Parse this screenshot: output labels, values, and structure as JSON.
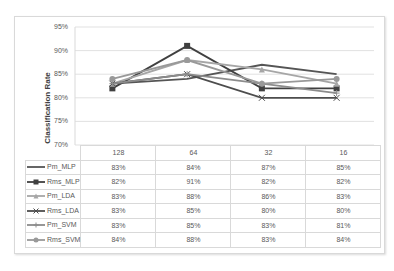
{
  "chart_data": {
    "type": "line",
    "title": "",
    "xlabel": "",
    "ylabel": "Classification Rate",
    "ylim": [
      70,
      95
    ],
    "yticks": [
      "95%",
      "90%",
      "85%",
      "80%",
      "75%",
      "70%"
    ],
    "grid": true,
    "legend_position": "data-table",
    "categories": [
      "128",
      "64",
      "32",
      "16"
    ],
    "series": [
      {
        "name": "Pm_MLP",
        "values": [
          83,
          84,
          87,
          85
        ],
        "labels": [
          "83%",
          "84%",
          "87%",
          "85%"
        ],
        "color": "#555555",
        "marker": "none"
      },
      {
        "name": "Rms_MLP",
        "values": [
          82,
          91,
          82,
          82
        ],
        "labels": [
          "82%",
          "91%",
          "82%",
          "82%"
        ],
        "color": "#404040",
        "marker": "square"
      },
      {
        "name": "Pm_LDA",
        "values": [
          83,
          88,
          86,
          83
        ],
        "labels": [
          "83%",
          "88%",
          "86%",
          "83%"
        ],
        "color": "#a6a6a6",
        "marker": "triangle"
      },
      {
        "name": "Rms_LDA",
        "values": [
          83,
          85,
          80,
          80
        ],
        "labels": [
          "83%",
          "85%",
          "80%",
          "80%"
        ],
        "color": "#4d4d4d",
        "marker": "x"
      },
      {
        "name": "Pm_SVM",
        "values": [
          83,
          85,
          83,
          81
        ],
        "labels": [
          "83%",
          "85%",
          "83%",
          "81%"
        ],
        "color": "#8c8c8c",
        "marker": "cross"
      },
      {
        "name": "Rms_SVM",
        "values": [
          84,
          88,
          83,
          84
        ],
        "labels": [
          "84%",
          "88%",
          "83%",
          "84%"
        ],
        "color": "#999999",
        "marker": "circle"
      }
    ]
  }
}
